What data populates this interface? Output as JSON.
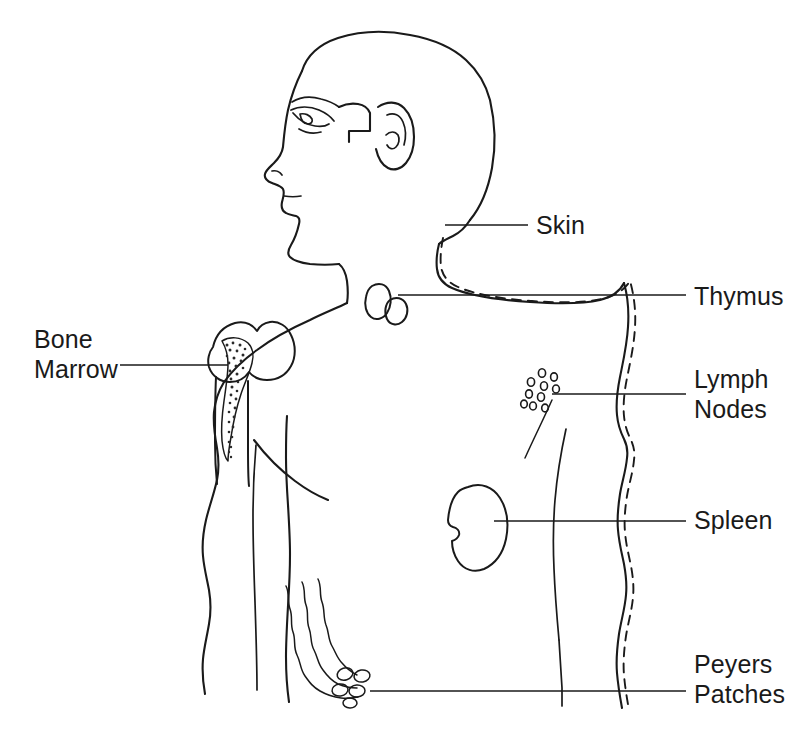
{
  "diagram": {
    "style": "black-and-white line drawing",
    "background_color": "#ffffff",
    "line_color": "#1a1a1a"
  },
  "labels": [
    {
      "id": "skin",
      "text": "Skin",
      "lines": [
        "Skin"
      ],
      "side": "right",
      "text_x": 536,
      "text_y": 234,
      "leader": {
        "from_x": 445,
        "from_y": 225,
        "to_x": 528,
        "to_y": 225
      },
      "target": "dashed outline tracing the body contour"
    },
    {
      "id": "thymus",
      "text": "Thymus",
      "lines": [
        "Thymus"
      ],
      "side": "right",
      "text_x": 694,
      "text_y": 305,
      "leader": {
        "from_x": 398,
        "from_y": 295,
        "to_x": 686,
        "to_y": 295
      },
      "target": "bilobed organ above the heart"
    },
    {
      "id": "lymph-nodes",
      "text": "Lymph Nodes",
      "lines": [
        "Lymph",
        "Nodes"
      ],
      "side": "right",
      "text_x": 694,
      "text_y": 388,
      "leader": {
        "from_x": 552,
        "from_y": 394,
        "to_x": 686,
        "to_y": 394
      },
      "target": "cluster of small oval nodes in the axillary region"
    },
    {
      "id": "spleen",
      "text": "Spleen",
      "lines": [
        "Spleen"
      ],
      "side": "right",
      "text_x": 694,
      "text_y": 529,
      "leader": {
        "from_x": 494,
        "from_y": 521,
        "to_x": 686,
        "to_y": 521
      },
      "target": "bean shaped organ in the upper left abdomen"
    },
    {
      "id": "peyers-patches",
      "text": "Peyers Patches",
      "lines": [
        "Peyers",
        "Patches"
      ],
      "side": "right",
      "text_x": 694,
      "text_y": 673,
      "leader": {
        "from_x": 370,
        "from_y": 691,
        "to_x": 686,
        "to_y": 691
      },
      "target": "oval patches on the small intestine"
    },
    {
      "id": "bone-marrow",
      "text": "Bone Marrow",
      "lines": [
        "Bone",
        "Marrow"
      ],
      "side": "left",
      "text_x": 112,
      "text_y": 348,
      "leader": {
        "from_x": 120,
        "from_y": 365,
        "to_x": 228,
        "to_y": 365
      },
      "target": "stippled cavity inside the humerus"
    }
  ],
  "organs": [
    {
      "id": "thymus",
      "name": "thymus",
      "shape": "bilobed",
      "center_x": 385,
      "center_y": 300
    },
    {
      "id": "lymph-nodes",
      "name": "lymph nodes",
      "shape": "cluster",
      "count": 10,
      "center_x": 543,
      "center_y": 392
    },
    {
      "id": "spleen",
      "name": "spleen",
      "shape": "bean",
      "center_x": 478,
      "center_y": 522
    },
    {
      "id": "peyers-patches",
      "name": "peyers patches",
      "shape": "oval-cluster",
      "count": 5,
      "center_x": 350,
      "center_y": 684
    },
    {
      "id": "bone-marrow",
      "name": "bone marrow",
      "shape": "stippled-cavity",
      "center_x": 222,
      "center_y": 390
    },
    {
      "id": "skin",
      "name": "skin",
      "shape": "dashed-outline"
    }
  ]
}
